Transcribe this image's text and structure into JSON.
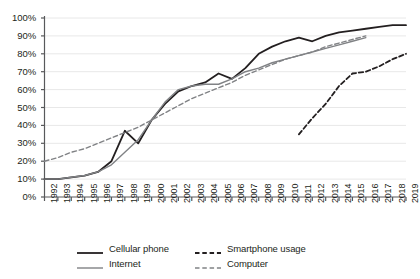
{
  "chart_data": {
    "type": "line",
    "title": "",
    "subtitle": "",
    "xlabel": "",
    "ylabel": "",
    "grid": "horizontal",
    "legend_position": "bottom",
    "ylim": [
      0,
      100
    ],
    "ytick_labels": [
      "0%",
      "10%",
      "20%",
      "30%",
      "40%",
      "50%",
      "60%",
      "70%",
      "80%",
      "90%",
      "100%"
    ],
    "ytick_values": [
      0,
      10,
      20,
      30,
      40,
      50,
      60,
      70,
      80,
      90,
      100
    ],
    "categories": [
      1992,
      1993,
      1994,
      1995,
      1996,
      1997,
      1998,
      1999,
      2000,
      2001,
      2002,
      2003,
      2004,
      2005,
      2006,
      2007,
      2008,
      2009,
      2010,
      2011,
      2012,
      2013,
      2014,
      2015,
      2016,
      2017,
      2018,
      2019
    ],
    "xtick_labels": [
      "1992",
      "1993",
      "1994",
      "1995",
      "1996",
      "1997",
      "1998",
      "1999",
      "2000",
      "2001",
      "2002",
      "2003",
      "2004",
      "2005",
      "2006",
      "2007",
      "2008",
      "2009",
      "2010",
      "2011",
      "2012",
      "2013",
      "2014",
      "2015",
      "2016",
      "2017",
      "2018",
      "2019"
    ],
    "series": [
      {
        "name": "Cellular phone",
        "style": "solid",
        "color": "#231f20",
        "x": [
          1992,
          1993,
          1994,
          1995,
          1996,
          1997,
          1998,
          1999,
          2000,
          2001,
          2002,
          2003,
          2004,
          2005,
          2006,
          2007,
          2008,
          2009,
          2010,
          2011,
          2012,
          2013,
          2014,
          2015,
          2016,
          2017,
          2018,
          2019
        ],
        "values": [
          10,
          10,
          11,
          12,
          14,
          20,
          37,
          30,
          43,
          52,
          59,
          62,
          64,
          69,
          66,
          72,
          80,
          84,
          87,
          89,
          87,
          90,
          92,
          93,
          94,
          95,
          96,
          96
        ]
      },
      {
        "name": "Internet",
        "style": "solid",
        "color": "#808285",
        "x": [
          1992,
          1993,
          1994,
          1995,
          1996,
          1997,
          1998,
          1999,
          2000,
          2001,
          2002,
          2003,
          2004,
          2005,
          2006,
          2007,
          2008,
          2009,
          2010,
          2011,
          2012,
          2013,
          2014,
          2015,
          2016
        ],
        "values": [
          10,
          10,
          11,
          12,
          14,
          18,
          25,
          32,
          43,
          53,
          60,
          62,
          63,
          63,
          66,
          70,
          72,
          75,
          77,
          79,
          81,
          83,
          85,
          87,
          89
        ]
      },
      {
        "name": "Smartphone usage",
        "style": "dashed",
        "color": "#231f20",
        "x": [
          2011,
          2012,
          2013,
          2014,
          2015,
          2016,
          2017,
          2018,
          2019
        ],
        "values": [
          35,
          44,
          52,
          62,
          69,
          70,
          73,
          77,
          80
        ]
      },
      {
        "name": "Computer",
        "style": "dashed",
        "color": "#808285",
        "x": [
          1992,
          1993,
          1994,
          1995,
          1996,
          1997,
          1998,
          1999,
          2000,
          2001,
          2002,
          2003,
          2004,
          2005,
          2006,
          2007,
          2008,
          2009,
          2010,
          2011,
          2012,
          2013,
          2014,
          2015,
          2016
        ],
        "values": [
          20,
          22,
          25,
          27,
          30,
          33,
          36,
          39,
          43,
          47,
          51,
          55,
          58,
          61,
          64,
          68,
          71,
          74,
          77,
          79,
          81,
          84,
          86,
          88,
          90
        ]
      }
    ]
  },
  "legend": {
    "entries": [
      {
        "label": "Cellular phone",
        "style": "solid",
        "color": "#231f20"
      },
      {
        "label": "Smartphone usage",
        "style": "dashed",
        "color": "#231f20"
      },
      {
        "label": "Internet",
        "style": "solid",
        "color": "#808285"
      },
      {
        "label": "Computer",
        "style": "dashed",
        "color": "#808285"
      }
    ]
  },
  "axes": {
    "y_axis_color": "#58595b",
    "x_axis_color": "#58595b",
    "gridline_color": "#e8e8e8"
  }
}
